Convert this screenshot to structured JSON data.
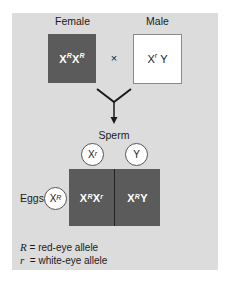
{
  "diagram": {
    "parents": {
      "female": {
        "label": "Female",
        "genotype_base": "X",
        "genotype": [
          {
            "base": "X",
            "sup": "R"
          },
          {
            "base": "X",
            "sup": "R"
          }
        ],
        "fill": "#5b5b5b"
      },
      "male": {
        "label": "Male",
        "genotype": [
          {
            "base": "X",
            "sup": "r"
          },
          {
            "base": "Y",
            "sup": ""
          }
        ],
        "fill": "#ffffff"
      },
      "cross_symbol": "×"
    },
    "gametes": {
      "sperm_label": "Sperm",
      "sperm": [
        {
          "base": "X",
          "sup": "r"
        },
        {
          "base": "Y",
          "sup": ""
        }
      ],
      "eggs_label": "Eggs",
      "eggs": [
        {
          "base": "X",
          "sup": "R"
        }
      ]
    },
    "offspring": [
      {
        "cells": [
          {
            "base": "X",
            "sup": "R"
          },
          {
            "base": "X",
            "sup": "r"
          }
        ]
      },
      {
        "cells": [
          {
            "base": "X",
            "sup": "R"
          },
          {
            "base": "Y",
            "sup": ""
          }
        ]
      }
    ],
    "legend": [
      {
        "symbol": "R",
        "text": "= red-eye allele"
      },
      {
        "symbol": "r",
        "text": "= white-eye allele"
      }
    ],
    "colors": {
      "panel": "#dcdcdc",
      "dark_box": "#5b5b5b",
      "arrow": "#1a1a1a"
    }
  }
}
